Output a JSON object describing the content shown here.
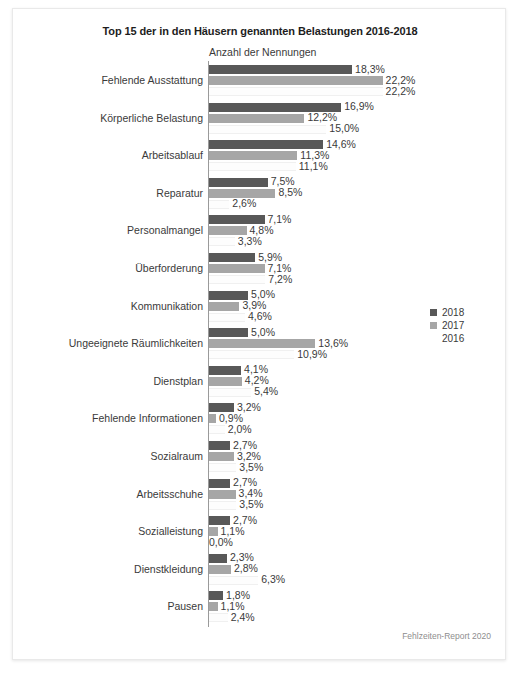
{
  "chart_data": {
    "type": "bar",
    "orientation": "horizontal",
    "title": "Top 15 der in den Häusern genannten Belastungen 2016-2018",
    "xlabel": "Anzahl der Nennungen",
    "ylabel": "",
    "grid": false,
    "legend_position": "right",
    "xlim": [
      0,
      25
    ],
    "value_suffix": "%",
    "decimal_separator": ",",
    "categories": [
      "Fehlende Ausstattung",
      "Körperliche Belastung",
      "Arbeitsablauf",
      "Reparatur",
      "Personalmangel",
      "Überforderung",
      "Kommunikation",
      "Ungeeignete Räumlichkeiten",
      "Dienstplan",
      "Fehlende Informationen",
      "Sozialraum",
      "Arbeitsschuhe",
      "Sozialleistung",
      "Dienstkleidung",
      "Pausen"
    ],
    "series": [
      {
        "name": "2018",
        "color": "#585858",
        "values": [
          18.3,
          16.9,
          14.6,
          7.5,
          7.1,
          5.9,
          5.0,
          5.0,
          4.1,
          3.2,
          2.7,
          2.7,
          2.7,
          2.3,
          1.8
        ],
        "labels": [
          "18,3%",
          "16,9%",
          "14,6%",
          "7,5%",
          "7,1%",
          "5,9%",
          "5,0%",
          "5,0%",
          "4,1%",
          "3,2%",
          "2,7%",
          "2,7%",
          "2,7%",
          "2,3%",
          "1,8%"
        ]
      },
      {
        "name": "2017",
        "color": "#a6a6a6",
        "values": [
          22.2,
          12.2,
          11.3,
          8.5,
          4.8,
          7.1,
          3.9,
          13.6,
          4.2,
          0.9,
          3.2,
          3.4,
          1.1,
          2.8,
          1.1
        ],
        "labels": [
          "22,2%",
          "12,2%",
          "11,3%",
          "8,5%",
          "4,8%",
          "7,1%",
          "3,9%",
          "13,6%",
          "4,2%",
          "0,9%",
          "3,2%",
          "3,4%",
          "1,1%",
          "2,8%",
          "1,1%"
        ]
      },
      {
        "name": "2016",
        "color": "#ffffff",
        "values": [
          22.2,
          15.0,
          11.1,
          2.6,
          3.3,
          7.2,
          4.6,
          10.9,
          5.4,
          2.0,
          3.5,
          3.5,
          0.0,
          6.3,
          2.4
        ],
        "labels": [
          "22,2%",
          "15,0%",
          "11,1%",
          "2,6%",
          "3,3%",
          "7,2%",
          "4,6%",
          "10,9%",
          "5,4%",
          "2,0%",
          "3,5%",
          "3,5%",
          "0,0%",
          "6,3%",
          "2,4%"
        ]
      }
    ],
    "legend": [
      "2018",
      "2017",
      "2016"
    ],
    "source_note": "Fehlzeiten-Report 2020"
  },
  "colors": {
    "series_2018": "#585858",
    "series_2017": "#a6a6a6",
    "series_2016": "#ffffff",
    "axis": "#9a9a9a",
    "text": "#3a3a3a",
    "note": "#8e8e8e"
  }
}
